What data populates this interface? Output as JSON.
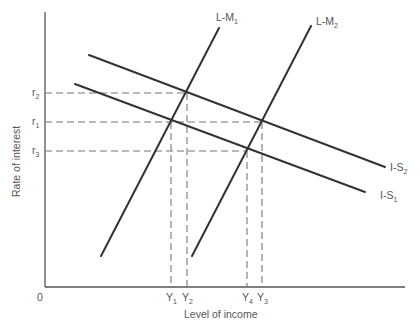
{
  "diagram": {
    "type": "IS-LM diagram",
    "axes": {
      "x_label": "Level of income",
      "y_label": "Rate of interest",
      "origin_label": "0"
    },
    "curves": [
      {
        "id": "lm1",
        "label": "L-M",
        "subscript": "1",
        "kind": "LM"
      },
      {
        "id": "lm2",
        "label": "L-M",
        "subscript": "2",
        "kind": "LM"
      },
      {
        "id": "is1",
        "label": "I-S",
        "subscript": "1",
        "kind": "IS"
      },
      {
        "id": "is2",
        "label": "I-S",
        "subscript": "2",
        "kind": "IS"
      }
    ],
    "interest_rates": [
      {
        "id": "r2",
        "label": "r",
        "subscript": "2"
      },
      {
        "id": "r1",
        "label": "r",
        "subscript": "1"
      },
      {
        "id": "r3",
        "label": "r",
        "subscript": "3"
      }
    ],
    "income_levels": [
      {
        "id": "y1",
        "label": "Y",
        "subscript": "1"
      },
      {
        "id": "y2",
        "label": "Y",
        "subscript": "2"
      },
      {
        "id": "y4",
        "label": "Y",
        "subscript": "4"
      },
      {
        "id": "y3",
        "label": "Y",
        "subscript": "3"
      }
    ],
    "equilibria": [
      {
        "curves": [
          "lm1",
          "is1"
        ],
        "rate": "r1",
        "income": "Y1"
      },
      {
        "curves": [
          "lm1",
          "is2"
        ],
        "rate": "r2",
        "income": "Y2"
      },
      {
        "curves": [
          "lm2",
          "is1"
        ],
        "rate": "r3",
        "income": "Y4"
      },
      {
        "curves": [
          "lm2",
          "is2"
        ],
        "rate": "r1",
        "income": "Y3"
      }
    ],
    "colors": {
      "curve": "#333333",
      "axis": "#555555",
      "guide": "#777777",
      "text": "#555555"
    }
  }
}
